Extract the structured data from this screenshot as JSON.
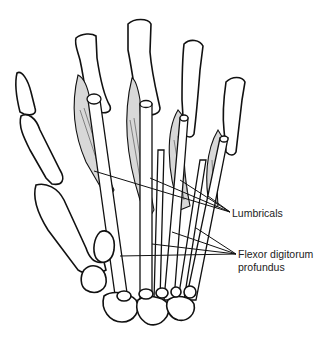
{
  "figure": {
    "labels": [
      {
        "id": "lumbricals",
        "text": "Lumbricals"
      },
      {
        "id": "fdp",
        "line1": "Flexor digitorum",
        "line2": "profundus"
      }
    ],
    "colors": {
      "line": "#111111",
      "background": "#ffffff",
      "shading": "#d8d8d8"
    }
  }
}
